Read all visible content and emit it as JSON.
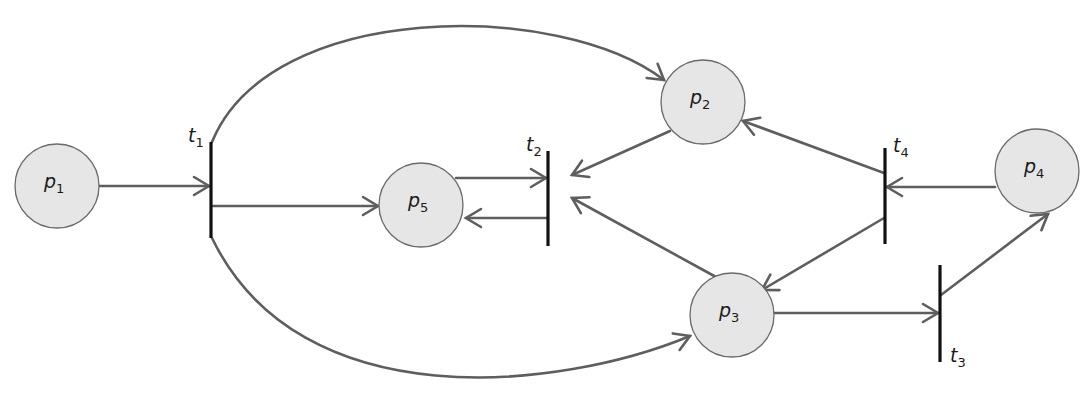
{
  "diagram": {
    "type": "petri-net",
    "colors": {
      "place_fill": "#e6e6e6",
      "place_stroke": "#6a6a6a",
      "arc": "#5e5e5e",
      "transition": "#111111",
      "background": "#ffffff"
    },
    "places": [
      {
        "id": "p1",
        "base": "p",
        "sub": "1",
        "cx": 57,
        "cy": 186,
        "r": 42
      },
      {
        "id": "p2",
        "base": "p",
        "sub": "2",
        "cx": 703,
        "cy": 102,
        "r": 42
      },
      {
        "id": "p3",
        "base": "p",
        "sub": "3",
        "cx": 732,
        "cy": 315,
        "r": 42
      },
      {
        "id": "p4",
        "base": "p",
        "sub": "4",
        "cx": 1037,
        "cy": 171,
        "r": 42
      },
      {
        "id": "p5",
        "base": "p",
        "sub": "5",
        "cx": 421,
        "cy": 205,
        "r": 42
      }
    ],
    "transitions": [
      {
        "id": "t1",
        "base": "t",
        "sub": "1",
        "x": 211,
        "y1": 142,
        "y2": 238,
        "lx": 188,
        "ly": 142
      },
      {
        "id": "t2",
        "base": "t",
        "sub": "2",
        "x": 548,
        "y1": 151,
        "y2": 246,
        "lx": 526,
        "ly": 151
      },
      {
        "id": "t3",
        "base": "t",
        "sub": "3",
        "x": 940,
        "y1": 265,
        "y2": 362,
        "lx": 950,
        "ly": 362
      },
      {
        "id": "t4",
        "base": "t",
        "sub": "4",
        "x": 885,
        "y1": 148,
        "y2": 244,
        "lx": 893,
        "ly": 152
      }
    ],
    "arcs": [
      {
        "from": "p1",
        "to": "t1",
        "path": "M99,186 L209,186",
        "tip": [
          209,
          186
        ],
        "dir": [
          1,
          0
        ]
      },
      {
        "from": "t1",
        "to": "p2",
        "path": "M212,142 C270,0 560,0 664,80",
        "tip": [
          664,
          80
        ],
        "dir": [
          0.79,
          0.61
        ]
      },
      {
        "from": "t1",
        "to": "p5",
        "path": "M213,206 L378,206",
        "tip": [
          378,
          206
        ],
        "dir": [
          1,
          0
        ]
      },
      {
        "from": "t1",
        "to": "p3",
        "path": "M212,238 C300,420 560,390 690,336",
        "tip": [
          690,
          336
        ],
        "dir": [
          0.92,
          -0.38
        ]
      },
      {
        "from": "p5",
        "to": "t2",
        "path": "M456,178 L546,178",
        "tip": [
          546,
          178
        ],
        "dir": [
          1,
          0
        ]
      },
      {
        "from": "t2",
        "to": "p5",
        "path": "M548,218 L466,218",
        "tip": [
          466,
          218
        ],
        "dir": [
          -1,
          0
        ]
      },
      {
        "from": "p2",
        "to": "t2",
        "path": "M670,131 L572,175",
        "tip": [
          572,
          175
        ],
        "dir": [
          -0.91,
          0.41
        ]
      },
      {
        "from": "p3",
        "to": "t2",
        "path": "M716,277 L572,198",
        "tip": [
          572,
          198
        ],
        "dir": [
          -0.88,
          -0.48
        ]
      },
      {
        "from": "t4",
        "to": "p2",
        "path": "M884,173 L743,121",
        "tip": [
          743,
          121
        ],
        "dir": [
          -0.94,
          -0.35
        ]
      },
      {
        "from": "t4",
        "to": "p3",
        "path": "M884,218 L762,290",
        "tip": [
          762,
          290
        ],
        "dir": [
          -0.86,
          0.51
        ]
      },
      {
        "from": "p4",
        "to": "t4",
        "path": "M995,187 L887,187",
        "tip": [
          887,
          187
        ],
        "dir": [
          -1,
          0
        ]
      },
      {
        "from": "p3",
        "to": "t3",
        "path": "M774,313 L938,313",
        "tip": [
          938,
          313
        ],
        "dir": [
          1,
          0
        ]
      },
      {
        "from": "t3",
        "to": "p4",
        "path": "M941,295 L1048,214",
        "tip": [
          1048,
          214
        ],
        "dir": [
          0.8,
          -0.6
        ]
      }
    ]
  }
}
